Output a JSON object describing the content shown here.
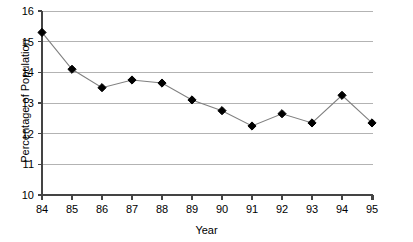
{
  "chart_data": {
    "type": "line",
    "title": "",
    "xlabel": "Year",
    "ylabel": "Percentage of Population",
    "categories": [
      "84",
      "85",
      "86",
      "87",
      "88",
      "89",
      "90",
      "91",
      "92",
      "93",
      "94",
      "95"
    ],
    "values": [
      15.3,
      14.1,
      13.5,
      13.75,
      13.65,
      13.1,
      12.75,
      12.25,
      12.65,
      12.35,
      13.25,
      12.35
    ],
    "series": [
      {
        "name": "Percentage of Population",
        "values": [
          15.3,
          14.1,
          13.5,
          13.75,
          13.65,
          13.1,
          12.75,
          12.25,
          12.65,
          12.35,
          13.25,
          12.35
        ]
      }
    ],
    "ylim": [
      10,
      16
    ],
    "yticks": [
      10,
      11,
      12,
      13,
      14,
      15,
      16
    ],
    "ytick_labels": [
      "10",
      "11",
      "12",
      "13",
      "14",
      "15",
      "16"
    ],
    "xtick_labels": [
      "84",
      "85",
      "86",
      "87",
      "88",
      "89",
      "90",
      "91",
      "92",
      "93",
      "94",
      "95"
    ],
    "grid": "horizontal",
    "legend": "none",
    "marker": "diamond",
    "marker_color": "#000000",
    "line_color": "#808080",
    "gridline_color": "#b3b3b3",
    "axis_color": "#444444",
    "background": "#ffffff"
  },
  "labels": {
    "x_axis_title": "Year",
    "y_axis_title": "Percentage of Population"
  },
  "artifacts": {
    "top_mark": "",
    "bottom_caption": ""
  }
}
